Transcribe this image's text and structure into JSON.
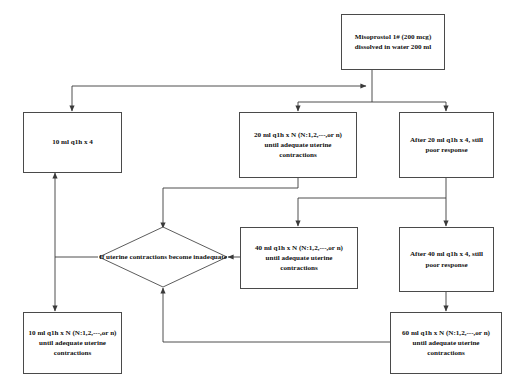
{
  "diagram": {
    "type": "flowchart",
    "background_color": "#ffffff",
    "node_border_color": "#4a4a4a",
    "edge_color": "#3a3a3a",
    "text_color": "#111111"
  },
  "nodes": {
    "start": {
      "shape": "rectangle",
      "line1": "Misoprostol 1# (200 mcg)",
      "line2": "dissolved in water 200 ml"
    },
    "dose10_fixed": {
      "shape": "rectangle",
      "line1": "10 ml q1h x 4"
    },
    "dose20_titrate": {
      "shape": "rectangle",
      "line1": "20 ml q1h x N (N:1,2,---,or n)",
      "line2": "until adequate uterine",
      "line3": "contractions"
    },
    "after20_poor": {
      "shape": "rectangle",
      "line1": "After 20 ml q1h x 4, still",
      "line2": "poor response"
    },
    "decision_inadequate": {
      "shape": "diamond",
      "line1": "If uterine contractions",
      "line2": "become inadequate"
    },
    "dose40_titrate": {
      "shape": "rectangle",
      "line1": "40 ml q1h x N (N:1,2,---,or n)",
      "line2": "until adequate uterine",
      "line3": "contractions"
    },
    "after40_poor": {
      "shape": "rectangle",
      "line1": "After 40 ml q1h x 4, still",
      "line2": "poor response"
    },
    "dose10_titrate": {
      "shape": "rectangle",
      "line1": "10 ml q1h x N (N:1,2,---,or n)",
      "line2": "until adequate uterine",
      "line3": "contractions"
    },
    "dose60_titrate": {
      "shape": "rectangle",
      "line1": "60 ml q1h x N (N:1,2,---,or n)",
      "line2": "until adequate uterine",
      "line3": "contractions"
    }
  },
  "edges": [
    {
      "from": "start",
      "to": "dose20_titrate"
    },
    {
      "from": "start",
      "to": "after20_poor"
    },
    {
      "from": "start",
      "to": "dose10_fixed"
    },
    {
      "from": "dose20_titrate",
      "to": "decision_inadequate"
    },
    {
      "from": "after20_poor",
      "to": "dose40_titrate"
    },
    {
      "from": "after20_poor",
      "to": "after40_poor"
    },
    {
      "from": "dose40_titrate",
      "to": "decision_inadequate"
    },
    {
      "from": "after40_poor",
      "to": "dose60_titrate"
    },
    {
      "from": "dose60_titrate",
      "to": "decision_inadequate"
    },
    {
      "from": "decision_inadequate",
      "to": "dose10_fixed"
    },
    {
      "from": "decision_inadequate",
      "to": "dose10_titrate"
    }
  ]
}
